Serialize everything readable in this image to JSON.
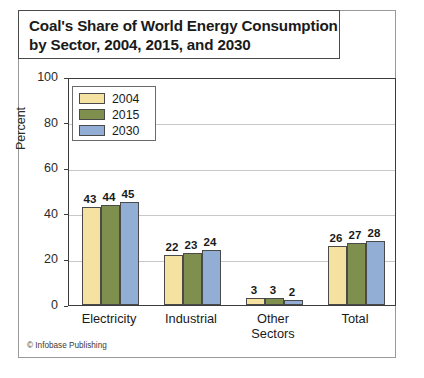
{
  "title": {
    "line1": "Coal's Share of World Energy Consumption",
    "line2": "by Sector, 2004, 2015, and 2030",
    "full": "Coal's Share of World Energy Consumption\nby Sector, 2004, 2015, and 2030"
  },
  "footer": {
    "credit": "© Infobase Publishing"
  },
  "legend": {
    "items": [
      {
        "label": "2004",
        "color": "#f5e2a0"
      },
      {
        "label": "2015",
        "color": "#7f8f4e"
      },
      {
        "label": "2030",
        "color": "#93aed4"
      }
    ]
  },
  "axis": {
    "y_title": "Percent",
    "y_ticks": [
      "0",
      "20",
      "40",
      "60",
      "80",
      "100"
    ],
    "x_categories": [
      "Electricity",
      "Industrial",
      "Other\nSectors",
      "Total"
    ]
  },
  "values": {
    "electricity": {
      "y2004": "43",
      "y2015": "44",
      "y2030": "45"
    },
    "industrial": {
      "y2004": "22",
      "y2015": "23",
      "y2030": "24"
    },
    "other_sectors": {
      "y2004": "3",
      "y2015": "3",
      "y2030": "2"
    },
    "total": {
      "y2004": "26",
      "y2015": "27",
      "y2030": "28"
    }
  },
  "chart_data": {
    "type": "bar",
    "title": "Coal's Share of World Energy Consumption by Sector, 2004, 2015, and 2030",
    "xlabel": "",
    "ylabel": "Percent",
    "ylim": [
      0,
      100
    ],
    "yticks": [
      0,
      20,
      40,
      60,
      80,
      100
    ],
    "grid": true,
    "legend_position": "top-left-inside",
    "categories": [
      "Electricity",
      "Industrial",
      "Other Sectors",
      "Total"
    ],
    "series": [
      {
        "name": "2004",
        "color": "#f5e2a0",
        "values": [
          43,
          22,
          3,
          26
        ]
      },
      {
        "name": "2015",
        "color": "#7f8f4e",
        "values": [
          44,
          23,
          3,
          27
        ]
      },
      {
        "name": "2030",
        "color": "#93aed4",
        "values": [
          45,
          24,
          2,
          28
        ]
      }
    ],
    "data_labels": true,
    "source": "© Infobase Publishing"
  }
}
